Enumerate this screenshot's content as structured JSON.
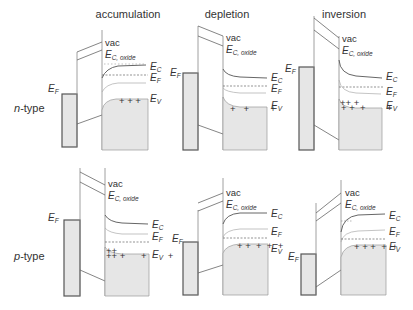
{
  "columns": [
    {
      "id": "accumulation",
      "label": "accumulation"
    },
    {
      "id": "depletion",
      "label": "depletion"
    },
    {
      "id": "inversion",
      "label": "inversion"
    }
  ],
  "rows": [
    {
      "id": "n-type",
      "label_italic": "n",
      "label_rest": "-type"
    },
    {
      "id": "p-type",
      "label_italic": "p",
      "label_rest": "-type"
    }
  ],
  "labels": {
    "vac": "vac",
    "E": "E",
    "C_oxide_sub": "C, oxide",
    "C_sub": "C",
    "F_sub": "F",
    "V_sub": "V",
    "metal_EF_sub": "F"
  },
  "colors": {
    "line": "#555555",
    "fill": "#e6e6e6",
    "light_line": "#aaaaaa",
    "dashed": "#666666"
  },
  "panels": [
    {
      "row": "n-type",
      "col": "accumulation",
      "carriers": "+ + +"
    },
    {
      "row": "n-type",
      "col": "depletion",
      "carriers": "+ + +"
    },
    {
      "row": "n-type",
      "col": "inversion",
      "carriers": "+ + + +"
    },
    {
      "row": "p-type",
      "col": "accumulation",
      "carriers": "+ + +"
    },
    {
      "row": "p-type",
      "col": "depletion",
      "carriers": "+ + + +"
    },
    {
      "row": "p-type",
      "col": "inversion",
      "carriers": "+ + + +"
    }
  ]
}
